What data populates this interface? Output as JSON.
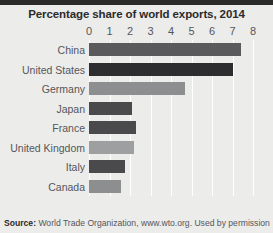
{
  "chart_data": {
    "type": "bar",
    "orientation": "horizontal",
    "title": "Percentage share of world exports, 2014",
    "xlabel": "",
    "ylabel": "",
    "xlim": [
      0,
      8
    ],
    "xticks": [
      0,
      1,
      2,
      3,
      4,
      5,
      6,
      7,
      8
    ],
    "grid": true,
    "legend": "none",
    "categories": [
      "China",
      "United States",
      "Germany",
      "Japan",
      "France",
      "United Kingdom",
      "Italy",
      "Canada"
    ],
    "values": [
      7.4,
      7.0,
      4.7,
      2.1,
      2.3,
      2.2,
      1.75,
      1.55
    ],
    "bar_colors": [
      "#5a5a5c",
      "#2d2d2f",
      "#8d8e90",
      "#4a4a4c",
      "#4a4a4c",
      "#9e9fa1",
      "#4a4a4c",
      "#8d8e90"
    ]
  },
  "source": {
    "prefix": "Source:",
    "text": "World Trade Organization, www.wto.org. Used by permission"
  },
  "style": {
    "background": "#ececeb",
    "band": "#2b2b2b",
    "grid_color": "#ffffff",
    "text_color": "#55565a",
    "title_color": "#2b2b2b"
  }
}
